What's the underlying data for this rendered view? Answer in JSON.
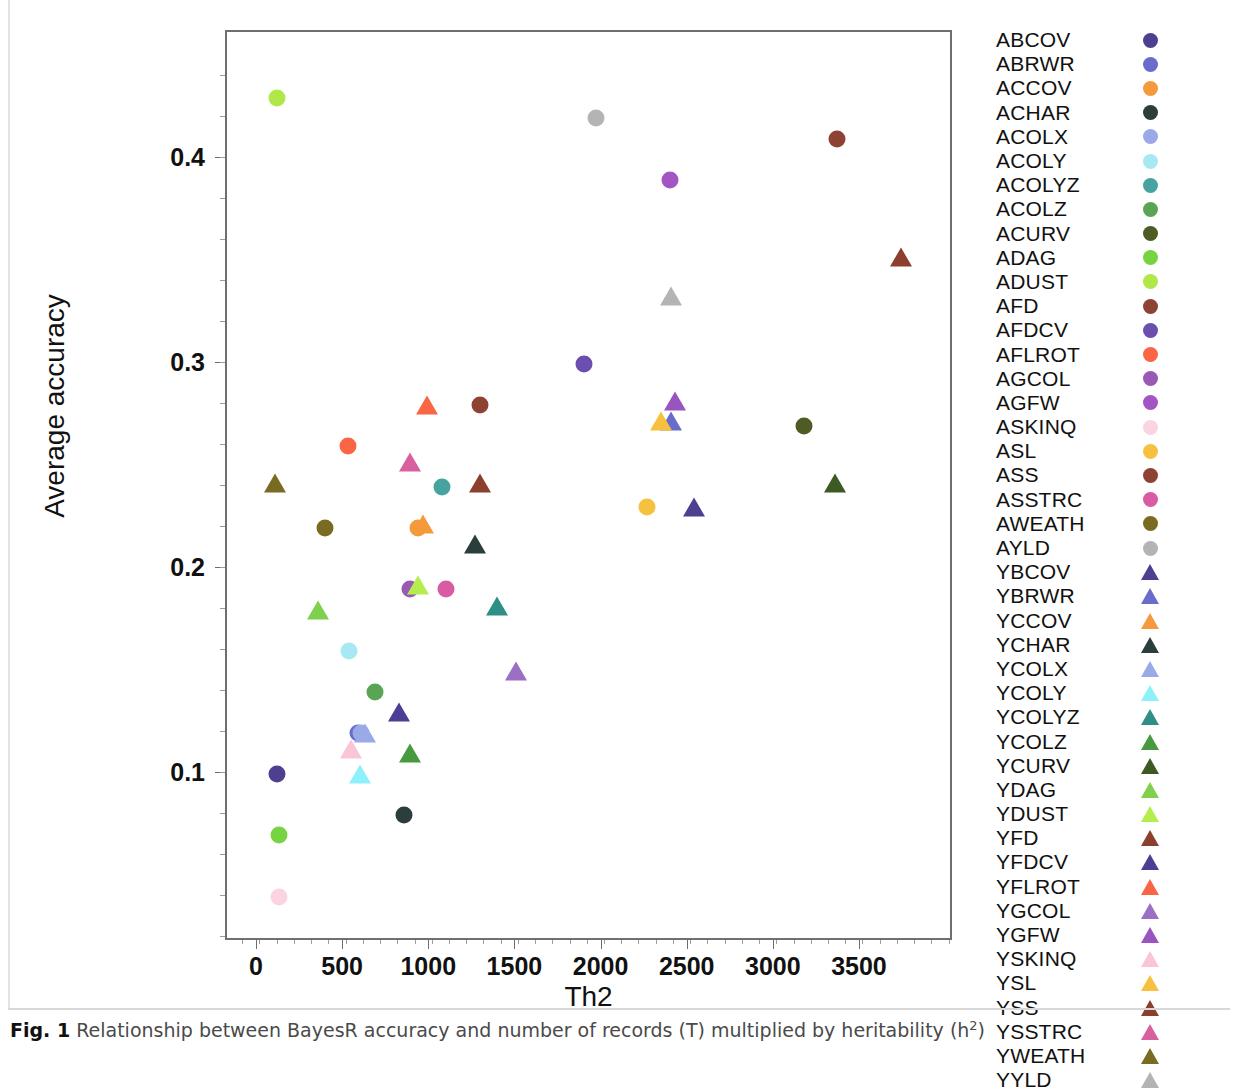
{
  "figure": {
    "caption_prefix": "Fig. 1",
    "caption_text": "Relationship between BayesR accuracy and number of records (T) multiplied by heritability (h",
    "caption_suffix": ")",
    "caption_sup": "2"
  },
  "axes": {
    "xlabel": "Th2",
    "ylabel": "Average accuracy",
    "xticks": [
      0,
      500,
      1000,
      1500,
      2000,
      2500,
      3000,
      3500
    ],
    "xtick_labels": [
      "0",
      "500",
      "1000",
      "1500",
      "2000",
      "2500",
      "3000",
      "3500"
    ],
    "yticks": [
      0.1,
      0.2,
      0.3,
      0.4
    ],
    "ytick_labels": [
      "0.1",
      "0.2",
      "0.3",
      "0.4"
    ],
    "xlim": [
      -180,
      4040
    ],
    "ylim": [
      0.018,
      0.462
    ]
  },
  "chart_data": {
    "type": "scatter",
    "title": "",
    "xlabel": "Th2",
    "ylabel": "Average accuracy",
    "xlim": [
      -180,
      4040
    ],
    "ylim": [
      0.018,
      0.462
    ],
    "grid": false,
    "legend_position": "right",
    "marker_shapes": {
      "A_traits": "circle",
      "Y_traits": "triangle"
    },
    "points": [
      {
        "name": "ABCOV",
        "shape": "circle",
        "color": "#4f3f91",
        "x": 110,
        "y": 0.1
      },
      {
        "name": "ABRWR",
        "shape": "circle",
        "color": "#6a6ccb",
        "x": 580,
        "y": 0.12
      },
      {
        "name": "ACCOV",
        "shape": "circle",
        "color": "#f49a3c",
        "x": 930,
        "y": 0.22
      },
      {
        "name": "ACHAR",
        "shape": "circle",
        "color": "#2b3e3c",
        "x": 850,
        "y": 0.08
      },
      {
        "name": "ACOLX",
        "shape": "circle",
        "color": "#9aa9e8",
        "x": 600,
        "y": 0.12
      },
      {
        "name": "ACOLY",
        "shape": "circle",
        "color": "#a7e8f2",
        "x": 530,
        "y": 0.16
      },
      {
        "name": "ACOLYZ",
        "shape": "circle",
        "color": "#46a3a0",
        "x": 1070,
        "y": 0.24
      },
      {
        "name": "ACOLZ",
        "shape": "circle",
        "color": "#5aa555",
        "x": 680,
        "y": 0.14
      },
      {
        "name": "ACURV",
        "shape": "circle",
        "color": "#4f5b24",
        "x": 3170,
        "y": 0.27
      },
      {
        "name": "ADAG",
        "shape": "circle",
        "color": "#76d443",
        "x": 120,
        "y": 0.07
      },
      {
        "name": "ADUST",
        "shape": "circle",
        "color": "#b0e84a",
        "x": 110,
        "y": 0.43
      },
      {
        "name": "AFD",
        "shape": "circle",
        "color": "#8e4233",
        "x": 1290,
        "y": 0.28
      },
      {
        "name": "AFDCV",
        "shape": "circle",
        "color": "#6a4fae",
        "x": 1890,
        "y": 0.3
      },
      {
        "name": "AFLROT",
        "shape": "circle",
        "color": "#f96545",
        "x": 520,
        "y": 0.26
      },
      {
        "name": "AGCOL",
        "shape": "circle",
        "color": "#9a59b5",
        "x": 880,
        "y": 0.19
      },
      {
        "name": "AGFW",
        "shape": "circle",
        "color": "#a355c4",
        "x": 2390,
        "y": 0.39
      },
      {
        "name": "ASKINQ",
        "shape": "circle",
        "color": "#fbd3e3",
        "x": 120,
        "y": 0.04
      },
      {
        "name": "ASL",
        "shape": "circle",
        "color": "#f6c13f",
        "x": 2260,
        "y": 0.23
      },
      {
        "name": "ASS",
        "shape": "circle",
        "color": "#8e4233",
        "x": 3360,
        "y": 0.41
      },
      {
        "name": "ASSTRC",
        "shape": "circle",
        "color": "#d85ba4",
        "x": 1090,
        "y": 0.19
      },
      {
        "name": "AWEATH",
        "shape": "circle",
        "color": "#7a6b22",
        "x": 390,
        "y": 0.22
      },
      {
        "name": "AYLD",
        "shape": "circle",
        "color": "#b4b4b4",
        "x": 1960,
        "y": 0.42
      },
      {
        "name": "YBCOV",
        "shape": "triangle",
        "color": "#4f3f91",
        "x": 2530,
        "y": 0.23
      },
      {
        "name": "YBRWR",
        "shape": "triangle",
        "color": "#6a6ccb",
        "x": 2400,
        "y": 0.272
      },
      {
        "name": "YCCOV",
        "shape": "triangle",
        "color": "#f49a3c",
        "x": 960,
        "y": 0.222
      },
      {
        "name": "YCHAR",
        "shape": "triangle",
        "color": "#2b3e3c",
        "x": 1260,
        "y": 0.212
      },
      {
        "name": "YCOLX",
        "shape": "triangle",
        "color": "#9aa9e8",
        "x": 620,
        "y": 0.12
      },
      {
        "name": "YCOLY",
        "shape": "triangle",
        "color": "#8df0fb",
        "x": 590,
        "y": 0.1
      },
      {
        "name": "YCOLYZ",
        "shape": "triangle",
        "color": "#2f8e86",
        "x": 1390,
        "y": 0.182
      },
      {
        "name": "YCOLZ",
        "shape": "triangle",
        "color": "#479a3f",
        "x": 880,
        "y": 0.11
      },
      {
        "name": "YCURV",
        "shape": "triangle",
        "color": "#3d5a25",
        "x": 3350,
        "y": 0.242
      },
      {
        "name": "YDAG",
        "shape": "triangle",
        "color": "#7fd04d",
        "x": 350,
        "y": 0.18
      },
      {
        "name": "YDUST",
        "shape": "triangle",
        "color": "#b5ed4f",
        "x": 930,
        "y": 0.192
      },
      {
        "name": "YFD",
        "shape": "triangle",
        "color": "#8c3f2d",
        "x": 1290,
        "y": 0.242
      },
      {
        "name": "YFDCV",
        "shape": "triangle",
        "color": "#4b3e95",
        "x": 820,
        "y": 0.13
      },
      {
        "name": "YFLROT",
        "shape": "triangle",
        "color": "#f96545",
        "x": 980,
        "y": 0.28
      },
      {
        "name": "YGCOL",
        "shape": "triangle",
        "color": "#9a6fc4",
        "x": 1500,
        "y": 0.15
      },
      {
        "name": "YGFW",
        "shape": "triangle",
        "color": "#9a54c0",
        "x": 2420,
        "y": 0.282
      },
      {
        "name": "YSKINQ",
        "shape": "triangle",
        "color": "#fac5d6",
        "x": 540,
        "y": 0.112
      },
      {
        "name": "YSL",
        "shape": "triangle",
        "color": "#f6c13f",
        "x": 2340,
        "y": 0.272
      },
      {
        "name": "YSS",
        "shape": "triangle",
        "color": "#8c3f2d",
        "x": 3730,
        "y": 0.352
      },
      {
        "name": "YSSTRC",
        "shape": "triangle",
        "color": "#d8609f",
        "x": 880,
        "y": 0.252
      },
      {
        "name": "YWEATH",
        "shape": "triangle",
        "color": "#7a6b22",
        "x": 100,
        "y": 0.242
      },
      {
        "name": "YYLD",
        "shape": "triangle",
        "color": "#b4b4b4",
        "x": 2400,
        "y": 0.333
      }
    ]
  },
  "legend": {
    "items": [
      {
        "label": "ABCOV",
        "shape": "circle",
        "color": "#4f3f91"
      },
      {
        "label": "ABRWR",
        "shape": "circle",
        "color": "#6a6ccb"
      },
      {
        "label": "ACCOV",
        "shape": "circle",
        "color": "#f49a3c"
      },
      {
        "label": "ACHAR",
        "shape": "circle",
        "color": "#2b3e3c"
      },
      {
        "label": "ACOLX",
        "shape": "circle",
        "color": "#9aa9e8"
      },
      {
        "label": "ACOLY",
        "shape": "circle",
        "color": "#a7e8f2"
      },
      {
        "label": "ACOLYZ",
        "shape": "circle",
        "color": "#46a3a0"
      },
      {
        "label": "ACOLZ",
        "shape": "circle",
        "color": "#5aa555"
      },
      {
        "label": "ACURV",
        "shape": "circle",
        "color": "#4f5b24"
      },
      {
        "label": "ADAG",
        "shape": "circle",
        "color": "#76d443"
      },
      {
        "label": "ADUST",
        "shape": "circle",
        "color": "#b0e84a"
      },
      {
        "label": "AFD",
        "shape": "circle",
        "color": "#8e4233"
      },
      {
        "label": "AFDCV",
        "shape": "circle",
        "color": "#6a4fae"
      },
      {
        "label": "AFLROT",
        "shape": "circle",
        "color": "#f96545"
      },
      {
        "label": "AGCOL",
        "shape": "circle",
        "color": "#9a59b5"
      },
      {
        "label": "AGFW",
        "shape": "circle",
        "color": "#a355c4"
      },
      {
        "label": "ASKINQ",
        "shape": "circle",
        "color": "#fbd3e3"
      },
      {
        "label": "ASL",
        "shape": "circle",
        "color": "#f6c13f"
      },
      {
        "label": "ASS",
        "shape": "circle",
        "color": "#8e4233"
      },
      {
        "label": "ASSTRC",
        "shape": "circle",
        "color": "#d85ba4"
      },
      {
        "label": "AWEATH",
        "shape": "circle",
        "color": "#7a6b22"
      },
      {
        "label": "AYLD",
        "shape": "circle",
        "color": "#b4b4b4"
      },
      {
        "label": "YBCOV",
        "shape": "triangle",
        "color": "#4f3f91"
      },
      {
        "label": "YBRWR",
        "shape": "triangle",
        "color": "#6a6ccb"
      },
      {
        "label": "YCCOV",
        "shape": "triangle",
        "color": "#f49a3c"
      },
      {
        "label": "YCHAR",
        "shape": "triangle",
        "color": "#2b3e3c"
      },
      {
        "label": "YCOLX",
        "shape": "triangle",
        "color": "#9aa9e8"
      },
      {
        "label": "YCOLY",
        "shape": "triangle",
        "color": "#8df0fb"
      },
      {
        "label": "YCOLYZ",
        "shape": "triangle",
        "color": "#2f8e86"
      },
      {
        "label": "YCOLZ",
        "shape": "triangle",
        "color": "#479a3f"
      },
      {
        "label": "YCURV",
        "shape": "triangle",
        "color": "#3d5a25"
      },
      {
        "label": "YDAG",
        "shape": "triangle",
        "color": "#7fd04d"
      },
      {
        "label": "YDUST",
        "shape": "triangle",
        "color": "#b5ed4f"
      },
      {
        "label": "YFD",
        "shape": "triangle",
        "color": "#8c3f2d"
      },
      {
        "label": "YFDCV",
        "shape": "triangle",
        "color": "#4b3e95"
      },
      {
        "label": "YFLROT",
        "shape": "triangle",
        "color": "#f96545"
      },
      {
        "label": "YGCOL",
        "shape": "triangle",
        "color": "#9a6fc4"
      },
      {
        "label": "YGFW",
        "shape": "triangle",
        "color": "#9a54c0"
      },
      {
        "label": "YSKINQ",
        "shape": "triangle",
        "color": "#fac5d6"
      },
      {
        "label": "YSL",
        "shape": "triangle",
        "color": "#f6c13f"
      },
      {
        "label": "YSS",
        "shape": "triangle",
        "color": "#8c3f2d"
      },
      {
        "label": "YSSTRC",
        "shape": "triangle",
        "color": "#d8609f"
      },
      {
        "label": "YWEATH",
        "shape": "triangle",
        "color": "#7a6b22"
      },
      {
        "label": "YYLD",
        "shape": "triangle",
        "color": "#b4b4b4"
      }
    ]
  }
}
